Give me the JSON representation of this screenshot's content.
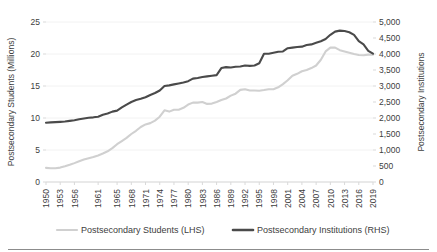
{
  "chart_data": {
    "type": "line",
    "title": "",
    "xlabel": "",
    "grid": true,
    "legend_position": "bottom",
    "x": [
      1950,
      1951,
      1952,
      1953,
      1954,
      1955,
      1956,
      1957,
      1958,
      1959,
      1960,
      1961,
      1962,
      1963,
      1964,
      1965,
      1966,
      1967,
      1968,
      1969,
      1970,
      1971,
      1972,
      1973,
      1974,
      1975,
      1976,
      1977,
      1978,
      1979,
      1980,
      1981,
      1982,
      1983,
      1984,
      1985,
      1986,
      1987,
      1988,
      1989,
      1990,
      1991,
      1992,
      1993,
      1994,
      1995,
      1996,
      1997,
      1998,
      1999,
      2000,
      2001,
      2002,
      2003,
      2004,
      2005,
      2006,
      2007,
      2008,
      2009,
      2010,
      2011,
      2012,
      2013,
      2014,
      2015,
      2016,
      2017,
      2018,
      2019
    ],
    "x_tick_labels": [
      "1950",
      "1953",
      "1956",
      "1961",
      "1965",
      "1968",
      "1971",
      "1974",
      "1977",
      "1980",
      "1983",
      "1986",
      "1989",
      "1992",
      "1995",
      "1998",
      "2001",
      "2004",
      "2007",
      "2010",
      "2013",
      "2016",
      "2019"
    ],
    "axes": [
      {
        "id": "left",
        "label": "Postsecondary Students (Millions)",
        "ticks": [
          0,
          5,
          10,
          15,
          20,
          25
        ],
        "tick_labels": [
          "0",
          "5",
          "10",
          "15",
          "20",
          "25"
        ],
        "lim": [
          0,
          25
        ]
      },
      {
        "id": "right",
        "label": "Postsecondary Institutions",
        "ticks": [
          0,
          500,
          1000,
          1500,
          2000,
          2500,
          3000,
          3500,
          4000,
          4500,
          5000
        ],
        "tick_labels": [
          "0",
          "500",
          "1,000",
          "1,500",
          "2,000",
          "2,500",
          "3,000",
          "3,500",
          "4,000",
          "4,500",
          "5,000"
        ],
        "lim": [
          0,
          5000
        ]
      }
    ],
    "series": [
      {
        "name": "Postsecondary Students (LHS)",
        "axis": "left",
        "color": "#d0d0d0",
        "unit": "millions",
        "values": [
          2.2,
          2.15,
          2.15,
          2.25,
          2.45,
          2.68,
          2.95,
          3.25,
          3.5,
          3.7,
          3.9,
          4.15,
          4.45,
          4.8,
          5.3,
          5.9,
          6.4,
          6.9,
          7.5,
          8.0,
          8.6,
          9.0,
          9.2,
          9.6,
          10.2,
          11.2,
          11.0,
          11.3,
          11.3,
          11.6,
          12.1,
          12.4,
          12.4,
          12.5,
          12.2,
          12.25,
          12.5,
          12.8,
          13.05,
          13.5,
          13.8,
          14.4,
          14.5,
          14.3,
          14.3,
          14.26,
          14.37,
          14.5,
          14.5,
          14.8,
          15.3,
          15.9,
          16.6,
          16.9,
          17.3,
          17.5,
          17.8,
          18.2,
          19.1,
          20.4,
          21.0,
          21.0,
          20.6,
          20.4,
          20.2,
          20.0,
          19.85,
          19.8,
          19.9,
          19.9
        ]
      },
      {
        "name": "Postsecondary Institutions (RHS)",
        "axis": "right",
        "color": "#4a4a4a",
        "unit": "institutions",
        "values": [
          1851,
          1863,
          1870,
          1880,
          1890,
          1910,
          1930,
          1960,
          1985,
          2008,
          2021,
          2040,
          2100,
          2140,
          2200,
          2230,
          2330,
          2420,
          2500,
          2560,
          2600,
          2650,
          2720,
          2780,
          2860,
          3000,
          3020,
          3050,
          3080,
          3110,
          3150,
          3230,
          3250,
          3280,
          3300,
          3320,
          3340,
          3560,
          3590,
          3580,
          3600,
          3610,
          3640,
          3630,
          3640,
          3710,
          4009,
          4010,
          4040,
          4070,
          4080,
          4180,
          4200,
          4220,
          4230,
          4280,
          4300,
          4350,
          4400,
          4470,
          4600,
          4700,
          4730,
          4720,
          4680,
          4600,
          4400,
          4300,
          4100,
          4010
        ]
      }
    ]
  },
  "legend": {
    "items": [
      {
        "label": "Postsecondary Students (LHS)",
        "color": "#d0d0d0"
      },
      {
        "label": "Postsecondary Institutions (RHS)",
        "color": "#4a4a4a"
      }
    ]
  }
}
